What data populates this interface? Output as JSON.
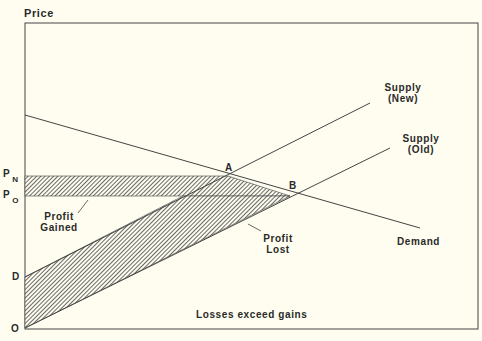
{
  "axes": {
    "y_label": "Price",
    "origin_label": "O"
  },
  "price_labels": {
    "pn_p": "P",
    "pn_sub": "N",
    "po_p": "P",
    "po_sub": "O",
    "d": "D"
  },
  "points": {
    "a": "A",
    "b": "B"
  },
  "curves": {
    "supply_new_line1": "Supply",
    "supply_new_line2": "(New)",
    "supply_old_line1": "Supply",
    "supply_old_line2": "(Old)",
    "demand": "Demand"
  },
  "regions": {
    "gained_line1": "Profit",
    "gained_line2": "Gained",
    "lost_line1": "Profit",
    "lost_line2": "Lost"
  },
  "caption": "Losses exceed gains",
  "colors": {
    "background": "#fefdf0",
    "ink": "#3a3a3a"
  }
}
